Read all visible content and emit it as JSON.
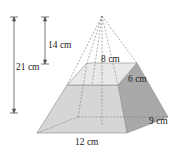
{
  "figure": {
    "type": "frustum-of-square-pyramid",
    "labels": {
      "total_height": "21 cm",
      "removed_height": "14 cm",
      "top_length": "8 cm",
      "top_width": "6 cm",
      "base_width": "9 cm",
      "base_length": "12 cm"
    },
    "colors": {
      "front_face": "#d6d6d6",
      "right_face": "#a9a9a9",
      "top_face": "#e6e6e6",
      "edge": "#8a8a8a",
      "dashed": "#7a7a7a",
      "dimension_line": "#555555"
    }
  }
}
